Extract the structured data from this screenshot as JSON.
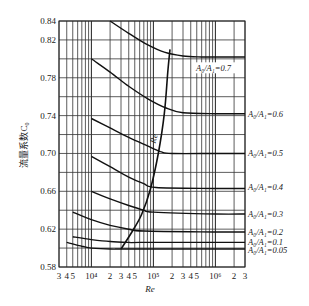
{
  "chart_data": {
    "type": "line",
    "title": "",
    "xlabel": "Re",
    "ylabel": "流量系数C0",
    "xscale": "log",
    "xlim": [
      3000,
      3000000
    ],
    "ylim": [
      0.58,
      0.84
    ],
    "grid": true,
    "y_ticks": [
      "0.58",
      "0.62",
      "0.66",
      "0.70",
      "0.74",
      "0.78",
      "0.82",
      "0.84"
    ],
    "y_tick_values": [
      0.58,
      0.62,
      0.66,
      0.7,
      0.74,
      0.78,
      0.82,
      0.84
    ],
    "x_tick_labels": [
      {
        "label": "3",
        "value": 3000
      },
      {
        "label": "4",
        "value": 4000
      },
      {
        "label": "5",
        "value": 5000
      },
      {
        "label": "10⁴",
        "value": 10000
      },
      {
        "label": "2",
        "value": 20000
      },
      {
        "label": "3",
        "value": 30000
      },
      {
        "label": "4",
        "value": 40000
      },
      {
        "label": "5",
        "value": 50000
      },
      {
        "label": "10⁵",
        "value": 100000
      },
      {
        "label": "2",
        "value": 200000
      },
      {
        "label": "3",
        "value": 300000
      },
      {
        "label": "4",
        "value": 400000
      },
      {
        "label": "5",
        "value": 500000
      },
      {
        "label": "10⁶",
        "value": 1000000
      },
      {
        "label": "2",
        "value": 2000000
      },
      {
        "label": "3",
        "value": 3000000
      }
    ],
    "series": [
      {
        "name": "A0/A1=0.7",
        "label": "A₀/A₁=0.7",
        "x": [
          20000,
          40000,
          80000,
          150000,
          300000,
          600000,
          1000000,
          3000000
        ],
        "y": [
          0.84,
          0.827,
          0.815,
          0.807,
          0.803,
          0.802,
          0.802,
          0.802
        ]
      },
      {
        "name": "A0/A1=0.6",
        "label": "A₀/A₁=0.6",
        "x": [
          10000,
          20000,
          40000,
          80000,
          160000,
          300000,
          1000000,
          3000000
        ],
        "y": [
          0.8,
          0.786,
          0.771,
          0.758,
          0.748,
          0.743,
          0.742,
          0.742
        ]
      },
      {
        "name": "A0/A1=0.5",
        "label": "A₀/A₁=0.5",
        "x": [
          10000,
          20000,
          40000,
          80000,
          130000,
          200000,
          1000000,
          3000000
        ],
        "y": [
          0.737,
          0.727,
          0.717,
          0.708,
          0.702,
          0.7,
          0.7,
          0.7
        ]
      },
      {
        "name": "A0/A1=0.4",
        "label": "A₀/A₁=0.4",
        "x": [
          10000,
          20000,
          40000,
          70000,
          110000,
          1000000,
          3000000
        ],
        "y": [
          0.697,
          0.686,
          0.675,
          0.668,
          0.664,
          0.663,
          0.663
        ]
      },
      {
        "name": "A0/A1=0.3",
        "label": "A₀/A₁=0.3",
        "x": [
          10000,
          20000,
          40000,
          70000,
          100000,
          1000000,
          3000000
        ],
        "y": [
          0.66,
          0.652,
          0.645,
          0.64,
          0.638,
          0.636,
          0.636
        ]
      },
      {
        "name": "A0/A1=0.2",
        "label": "A₀/A₁=0.2",
        "x": [
          5000,
          10000,
          20000,
          40000,
          70000,
          1000000,
          3000000
        ],
        "y": [
          0.638,
          0.63,
          0.624,
          0.62,
          0.618,
          0.617,
          0.617
        ]
      },
      {
        "name": "A0/A1=0.1",
        "label": "A₀/A₁=0.1",
        "x": [
          5000,
          10000,
          20000,
          40000,
          60000,
          1000000,
          3000000
        ],
        "y": [
          0.612,
          0.609,
          0.607,
          0.606,
          0.606,
          0.606,
          0.606
        ]
      },
      {
        "name": "A0/A1=0.05",
        "label": "A₀/A₁=0.05",
        "x": [
          4000,
          7000,
          10000,
          20000,
          40000,
          1000000,
          3000000
        ],
        "y": [
          0.606,
          0.602,
          0.6,
          0.599,
          0.599,
          0.599,
          0.599
        ]
      },
      {
        "name": "Re_t",
        "label": "Re",
        "x": [
          30000,
          45000,
          65000,
          90000,
          120000,
          150000,
          170000,
          185000
        ],
        "y": [
          0.599,
          0.617,
          0.636,
          0.663,
          0.7,
          0.742,
          0.785,
          0.81
        ]
      }
    ],
    "annotations": [
      {
        "text": "A₀/A₁=0.7",
        "position": "inside-right",
        "y": 0.79
      },
      {
        "text": "A₀/A₁=0.6",
        "position": "right-outside",
        "y": 0.742
      },
      {
        "text": "A₀/A₁=0.5",
        "position": "right-outside",
        "y": 0.7
      },
      {
        "text": "A₀/A₁=0.4",
        "position": "right-outside",
        "y": 0.665
      },
      {
        "text": "A₀/A₁=0.3",
        "position": "right-outside",
        "y": 0.636
      },
      {
        "text": "A₀/A₁=0.2",
        "position": "right-outside",
        "y": 0.617
      },
      {
        "text": "A₀/A₁=0.1",
        "position": "right-outside",
        "y": 0.606
      },
      {
        "text": "A₀/A₁=0.05",
        "position": "right-outside",
        "y": 0.598
      },
      {
        "text": "Re",
        "position": "along-curve",
        "x": 130000,
        "y": 0.715
      }
    ]
  },
  "labels": {
    "ylabel": "流量系数C",
    "ylabel_sub": "0",
    "xlabel": "Re",
    "re_curve": "Re",
    "re_curve_sub": "t"
  }
}
